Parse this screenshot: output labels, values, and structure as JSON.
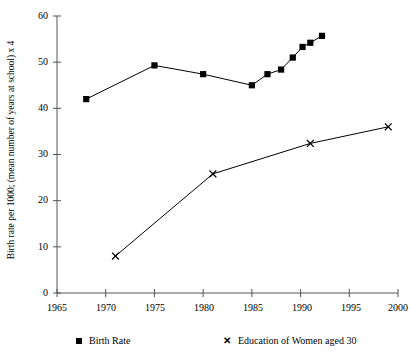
{
  "chart_data": {
    "type": "line",
    "title": "",
    "xlabel": "",
    "ylabel": "Birth rate per 1000; (mean number of years at school) x 4",
    "xlim": [
      1965,
      2000
    ],
    "ylim": [
      0,
      60
    ],
    "xticks": [
      1965,
      1970,
      1975,
      1980,
      1985,
      1990,
      1995,
      2000
    ],
    "yticks": [
      0,
      10,
      20,
      30,
      40,
      50,
      60
    ],
    "xtick_labels": [
      "1965",
      "1970",
      "1975",
      "1980",
      "1985",
      "1990",
      "1995",
      "2000"
    ],
    "ytick_labels": [
      "0",
      "10",
      "20",
      "30",
      "40",
      "50",
      "60"
    ],
    "grid": false,
    "legend_position": "bottom",
    "series": [
      {
        "name": "Birth Rate",
        "marker": "square",
        "color": "#000000",
        "points": [
          {
            "x": 1968.0,
            "y": 42.0
          },
          {
            "x": 1975.0,
            "y": 49.3
          },
          {
            "x": 1980.0,
            "y": 47.4
          },
          {
            "x": 1985.0,
            "y": 45.0
          },
          {
            "x": 1986.6,
            "y": 47.4
          },
          {
            "x": 1988.0,
            "y": 48.4
          },
          {
            "x": 1989.2,
            "y": 51.0
          },
          {
            "x": 1990.2,
            "y": 53.3
          },
          {
            "x": 1991.0,
            "y": 54.2
          },
          {
            "x": 1992.2,
            "y": 55.7
          }
        ]
      },
      {
        "name": "Education of Women aged 30",
        "marker": "cross",
        "color": "#000000",
        "points": [
          {
            "x": 1971.0,
            "y": 8.0
          },
          {
            "x": 1981.0,
            "y": 25.8
          },
          {
            "x": 1991.0,
            "y": 32.4
          },
          {
            "x": 1999.0,
            "y": 36.0
          }
        ]
      }
    ]
  },
  "legend": {
    "items": [
      {
        "label": "Birth Rate",
        "marker_glyph": "■"
      },
      {
        "label": "Education of Women aged 30",
        "marker_glyph": "✕"
      }
    ]
  },
  "axes": {
    "y_axis_title": "Birth rate per 1000; (mean number of years at school) x 4"
  }
}
